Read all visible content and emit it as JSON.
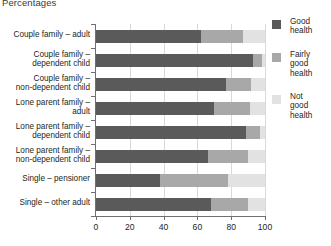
{
  "chart_data": {
    "type": "bar",
    "title": "Percentages",
    "orientation": "horizontal",
    "stacked": true,
    "stack_total": 100,
    "xlabel": "",
    "ylabel": "",
    "xlim": [
      0,
      100
    ],
    "xticks": [
      0,
      20,
      40,
      60,
      80,
      100
    ],
    "xtick_labels": [
      "0",
      "20",
      "40",
      "60",
      "80",
      "100"
    ],
    "grid": true,
    "grid_axis": "x",
    "legend_position": "right",
    "categories": [
      "Couple family – adult",
      "Couple family – dependent child",
      "Couple family – non-dependent child",
      "Lone parent family – adult",
      "Lone parent family – dependent child",
      "Lone parent family – non-dependent child",
      "Single – pensioner",
      "Single – other adult"
    ],
    "category_lines": [
      [
        "Couple family – adult"
      ],
      [
        "Couple family –",
        "dependent child"
      ],
      [
        "Couple family –",
        "non-dependent child"
      ],
      [
        "Lone parent family –",
        "adult"
      ],
      [
        "Lone parent family –",
        "dependent child"
      ],
      [
        "Lone parent family –",
        "non-dependent child"
      ],
      [
        "Single – pensioner"
      ],
      [
        "Single – other adult"
      ]
    ],
    "series": [
      {
        "name": "Good health",
        "name_lines": [
          "Good",
          "health"
        ],
        "color": "#5a5a5a",
        "values": [
          62,
          93,
          77,
          70,
          89,
          66,
          38,
          68
        ]
      },
      {
        "name": "Fairly good health",
        "name_lines": [
          "Fairly",
          "good",
          "health"
        ],
        "color": "#a8a8a8",
        "values": [
          25,
          5,
          15,
          21,
          8,
          24,
          40,
          22
        ]
      },
      {
        "name": "Not good health",
        "name_lines": [
          "Not",
          "good",
          "health"
        ],
        "color": "#e2e2e2",
        "values": [
          13,
          2,
          8,
          9,
          3,
          10,
          22,
          10
        ]
      }
    ]
  }
}
